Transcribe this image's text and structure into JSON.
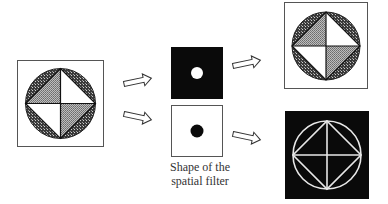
{
  "diagram": {
    "type": "spatial-filtering-illustration",
    "input_image": {
      "label": "input-pattern",
      "description": "Circle inscribed in square with diamond divided into four triangles; two triangles shaded, two white, outer segments dark-hatched"
    },
    "filters": [
      {
        "label": "high-pass-filter",
        "description": "Black square with small white circular opening"
      },
      {
        "label": "low-pass-filter",
        "description": "White square with small black circular dot"
      }
    ],
    "filter_caption_line1": "Shape of the",
    "filter_caption_line2": "spatial filter",
    "outputs": [
      {
        "label": "low-pass-output",
        "description": "Reproduction of input pattern with filled regions"
      },
      {
        "label": "high-pass-output",
        "description": "Edge outline (white lines) on black background"
      }
    ],
    "arrows": [
      {
        "from": "input",
        "to": "filter-top"
      },
      {
        "from": "input",
        "to": "filter-bottom"
      },
      {
        "from": "filter-top",
        "to": "output-top"
      },
      {
        "from": "filter-bottom",
        "to": "output-bottom"
      }
    ],
    "colors": {
      "black": "#0a0a0a",
      "white": "#ffffff",
      "frame": "#555555",
      "shade_light": "#9a9a9a",
      "shade_dark": "#2e2e2e"
    }
  }
}
